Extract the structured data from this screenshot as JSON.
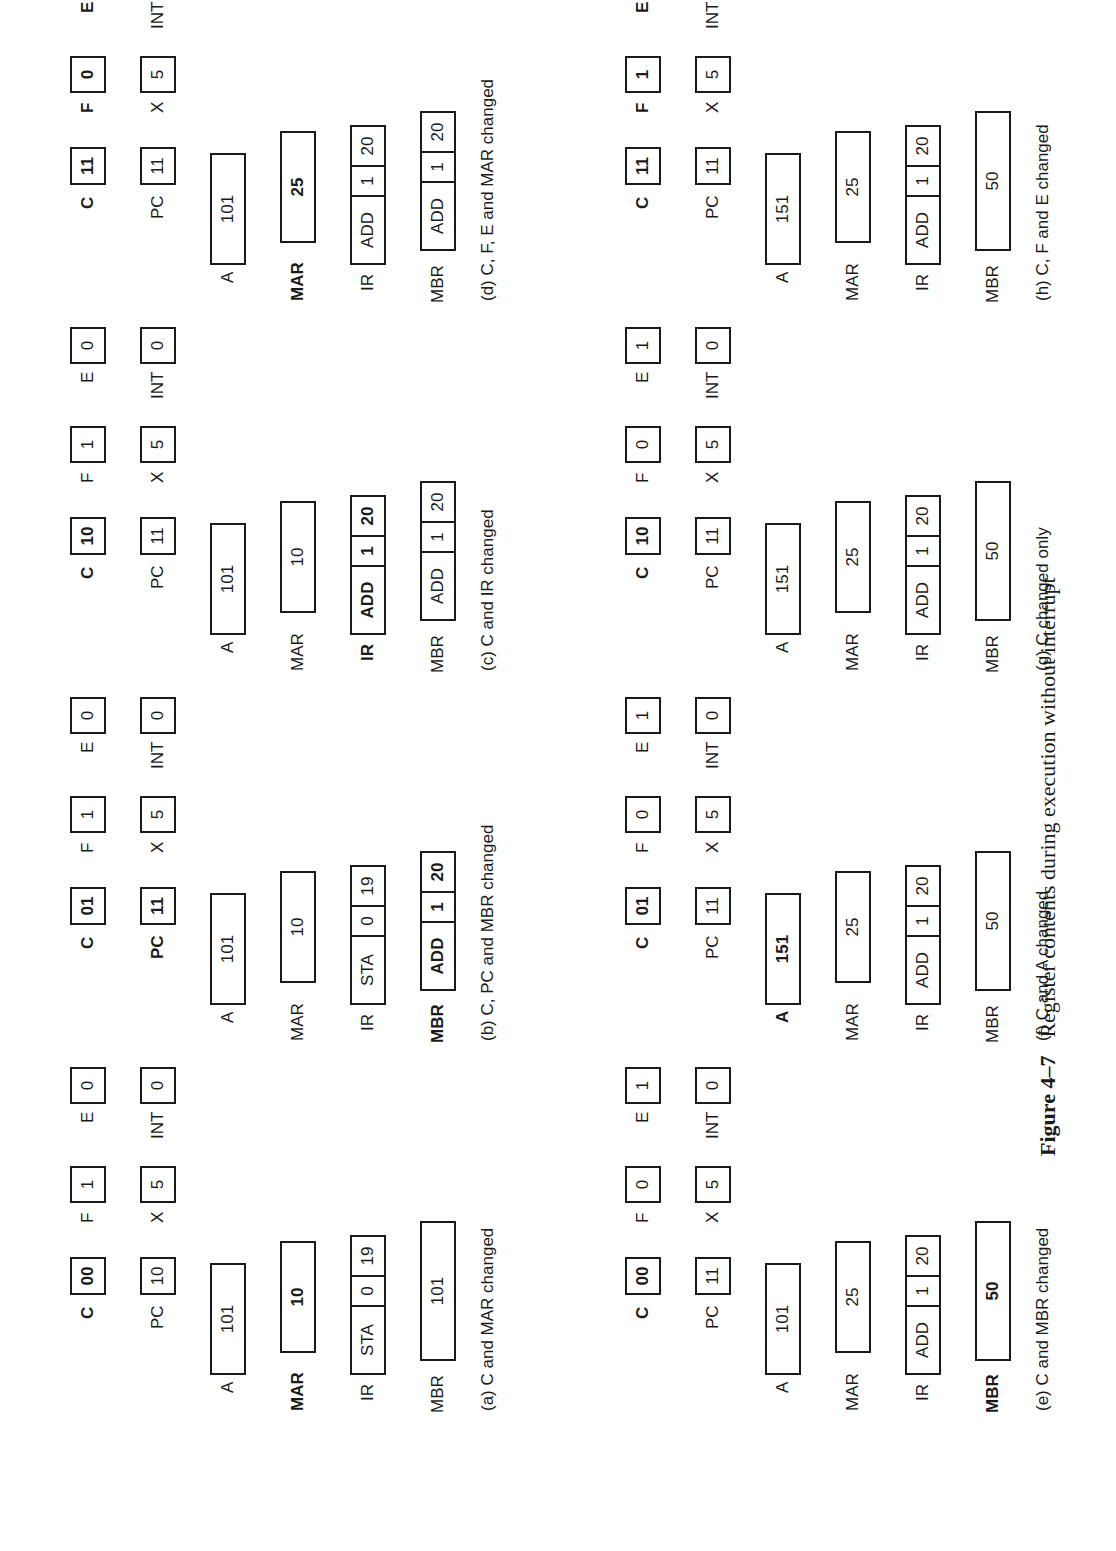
{
  "figure": {
    "number": "Figure 4–7",
    "title": "Register contents during execution without interrupt"
  },
  "panels": [
    {
      "id": "a",
      "caption": "(a)  C and MAR changed",
      "C": "00",
      "PC": "10",
      "F": "1",
      "X": "5",
      "E": "0",
      "INT": "0",
      "A": "101",
      "MAR": "10",
      "IR": [
        "STA",
        "0",
        "19"
      ],
      "MBR": [
        "101"
      ],
      "changed": [
        "C",
        "MAR"
      ]
    },
    {
      "id": "b",
      "caption": "(b)  C, PC and MBR changed",
      "C": "01",
      "PC": "11",
      "F": "1",
      "X": "5",
      "E": "0",
      "INT": "0",
      "A": "101",
      "MAR": "10",
      "IR": [
        "STA",
        "0",
        "19"
      ],
      "MBR": [
        "ADD",
        "1",
        "20"
      ],
      "changed": [
        "C",
        "PC",
        "MBR"
      ]
    },
    {
      "id": "c",
      "caption": "(c)  C and IR changed",
      "C": "10",
      "PC": "11",
      "F": "1",
      "X": "5",
      "E": "0",
      "INT": "0",
      "A": "101",
      "MAR": "10",
      "IR": [
        "ADD",
        "1",
        "20"
      ],
      "MBR": [
        "ADD",
        "1",
        "20"
      ],
      "changed": [
        "C",
        "IR"
      ]
    },
    {
      "id": "d",
      "caption": "(d)  C, F, E and MAR changed",
      "C": "11",
      "PC": "11",
      "F": "0",
      "X": "5",
      "E": "1",
      "INT": "0",
      "A": "101",
      "MAR": "25",
      "IR": [
        "ADD",
        "1",
        "20"
      ],
      "MBR": [
        "ADD",
        "1",
        "20"
      ],
      "changed": [
        "C",
        "F",
        "E",
        "MAR"
      ]
    },
    {
      "id": "e",
      "caption": "(e)  C and MBR changed",
      "C": "00",
      "PC": "11",
      "F": "0",
      "X": "5",
      "E": "1",
      "INT": "0",
      "A": "101",
      "MAR": "25",
      "IR": [
        "ADD",
        "1",
        "20"
      ],
      "MBR": [
        "50"
      ],
      "changed": [
        "C",
        "MBR"
      ]
    },
    {
      "id": "f",
      "caption": "(f)  C and A changed",
      "C": "01",
      "PC": "11",
      "F": "0",
      "X": "5",
      "E": "1",
      "INT": "0",
      "A": "151",
      "MAR": "25",
      "IR": [
        "ADD",
        "1",
        "20"
      ],
      "MBR": [
        "50"
      ],
      "changed": [
        "C",
        "A"
      ]
    },
    {
      "id": "g",
      "caption": "(g)  C changed only",
      "C": "10",
      "PC": "11",
      "F": "0",
      "X": "5",
      "E": "1",
      "INT": "0",
      "A": "151",
      "MAR": "25",
      "IR": [
        "ADD",
        "1",
        "20"
      ],
      "MBR": [
        "50"
      ],
      "changed": [
        "C"
      ]
    },
    {
      "id": "h",
      "caption": "(h)  C, F and E changed",
      "C": "11",
      "PC": "11",
      "F": "1",
      "X": "5",
      "E": "0",
      "INT": "0",
      "A": "151",
      "MAR": "25",
      "IR": [
        "ADD",
        "1",
        "20"
      ],
      "MBR": [
        "50"
      ],
      "changed": [
        "C",
        "F",
        "E"
      ]
    }
  ],
  "register_labels": {
    "C": "C",
    "PC": "PC",
    "F": "F",
    "X": "X",
    "E": "E",
    "INT": "INT",
    "A": "A",
    "MAR": "MAR",
    "IR": "IR",
    "MBR": "MBR"
  }
}
